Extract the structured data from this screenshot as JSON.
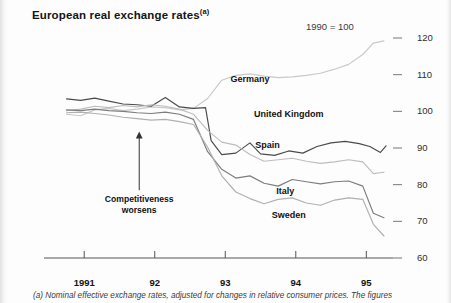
{
  "title": "European real exchange rates",
  "title_superscript": "(a)",
  "unit_note": "1990 = 100",
  "footnote": "(a) Nominal effective exchange rates, adjusted for changes in relative consumer prices. The figures",
  "annotation": {
    "line1": "Competitiveness",
    "line2": "worsens"
  },
  "chart_data": {
    "type": "line",
    "title": "European real exchange rates",
    "subtitle": "1990 = 100",
    "xlabel": "",
    "ylabel": "",
    "xlim": [
      1990.6,
      1995.35
    ],
    "ylim": [
      60,
      120
    ],
    "yticks": [
      60,
      70,
      80,
      90,
      100,
      110,
      120
    ],
    "xticks": [
      1991,
      1992,
      1993,
      1994,
      1995
    ],
    "xtick_labels": [
      "1991",
      "92",
      "93",
      "94",
      "95"
    ],
    "grid": false,
    "legend": "inline-labels",
    "axis_side": "right",
    "colors": {
      "germany": "#c9c9c9",
      "united_kingdom": "#4a4a4a",
      "spain": "#bdbdbd",
      "italy": "#7d7d7d",
      "sweden": "#b0b0b0"
    },
    "series": [
      {
        "name": "Germany",
        "label_x": 1993.35,
        "label_y": 108.5,
        "color": "#c9c9c9",
        "x": [
          1990.75,
          1990.95,
          1991.15,
          1991.35,
          1991.55,
          1991.75,
          1991.95,
          1992.15,
          1992.35,
          1992.55,
          1992.75,
          1992.95,
          1993.15,
          1993.35,
          1993.55,
          1993.75,
          1993.95,
          1994.15,
          1994.35,
          1994.55,
          1994.75,
          1994.95,
          1995.1,
          1995.25
        ],
        "values": [
          99.2,
          98.8,
          100.4,
          100.8,
          100.2,
          100.6,
          101.2,
          101.0,
          100.4,
          100.8,
          103.5,
          108.5,
          109.8,
          110.2,
          109.6,
          109.2,
          109.4,
          109.8,
          110.4,
          111.5,
          112.8,
          115.5,
          118.6,
          119.2
        ]
      },
      {
        "name": "United Kingdom",
        "label_x": 1993.9,
        "label_y": 99.0,
        "color": "#4a4a4a",
        "x": [
          1990.75,
          1990.95,
          1991.15,
          1991.35,
          1991.55,
          1991.75,
          1991.95,
          1992.15,
          1992.35,
          1992.55,
          1992.72,
          1992.8,
          1992.95,
          1993.15,
          1993.35,
          1993.5,
          1993.7,
          1993.9,
          1994.1,
          1994.3,
          1994.5,
          1994.7,
          1994.9,
          1995.05,
          1995.2,
          1995.28
        ],
        "values": [
          103.4,
          103.0,
          103.6,
          102.8,
          102.0,
          101.8,
          101.4,
          103.8,
          101.2,
          100.8,
          101.0,
          92.0,
          88.2,
          88.6,
          91.4,
          88.4,
          88.0,
          89.2,
          88.6,
          90.4,
          91.4,
          91.8,
          91.2,
          90.4,
          88.8,
          90.6
        ]
      },
      {
        "name": "Spain",
        "label_x": 1993.6,
        "label_y": 90.5,
        "color": "#bdbdbd",
        "x": [
          1990.75,
          1990.95,
          1991.15,
          1991.35,
          1991.55,
          1991.75,
          1991.95,
          1992.15,
          1992.35,
          1992.55,
          1992.75,
          1992.95,
          1993.15,
          1993.35,
          1993.55,
          1993.75,
          1993.95,
          1994.15,
          1994.35,
          1994.55,
          1994.75,
          1994.95,
          1995.1,
          1995.25
        ],
        "values": [
          100.2,
          100.6,
          101.4,
          101.0,
          101.6,
          101.2,
          101.8,
          101.4,
          100.6,
          99.2,
          94.8,
          91.6,
          90.8,
          88.2,
          86.4,
          86.8,
          87.2,
          86.4,
          85.8,
          86.2,
          86.8,
          86.2,
          83.0,
          83.4
        ]
      },
      {
        "name": "Italy",
        "label_x": 1993.85,
        "label_y": 78.0,
        "color": "#7d7d7d",
        "x": [
          1990.75,
          1990.95,
          1991.15,
          1991.35,
          1991.55,
          1991.75,
          1991.95,
          1992.15,
          1992.35,
          1992.55,
          1992.75,
          1992.95,
          1993.15,
          1993.35,
          1993.55,
          1993.75,
          1993.95,
          1994.15,
          1994.35,
          1994.55,
          1994.75,
          1994.95,
          1995.1,
          1995.25
        ],
        "values": [
          100.4,
          100.2,
          100.6,
          100.2,
          100.0,
          99.6,
          99.4,
          99.8,
          99.2,
          97.8,
          89.0,
          84.2,
          81.8,
          82.4,
          80.4,
          79.6,
          81.4,
          80.8,
          80.2,
          80.8,
          81.0,
          79.6,
          72.2,
          71.0
        ]
      },
      {
        "name": "Sweden",
        "label_x": 1993.9,
        "label_y": 71.5,
        "color": "#b0b0b0",
        "x": [
          1990.75,
          1990.95,
          1991.15,
          1991.35,
          1991.55,
          1991.75,
          1991.95,
          1992.15,
          1992.35,
          1992.55,
          1992.75,
          1992.95,
          1993.15,
          1993.35,
          1993.55,
          1993.75,
          1993.95,
          1994.15,
          1994.35,
          1994.55,
          1994.75,
          1994.95,
          1995.1,
          1995.25
        ],
        "values": [
          99.6,
          99.8,
          99.4,
          99.0,
          98.4,
          98.0,
          97.6,
          97.8,
          97.2,
          96.4,
          90.2,
          82.4,
          78.0,
          76.2,
          74.8,
          76.0,
          76.4,
          75.0,
          74.4,
          75.8,
          76.4,
          76.0,
          69.2,
          66.0
        ]
      }
    ]
  }
}
